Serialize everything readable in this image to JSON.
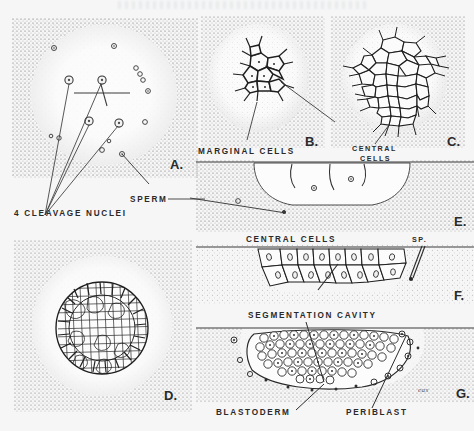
{
  "plate": {
    "title": "Cleavage and blastoderm formation plate",
    "background_color": "#f6f6f7",
    "ink_color": "#2a2a2a",
    "signature": "eas"
  },
  "panels": [
    {
      "id": "A",
      "marker": "A.",
      "view": "surface view of egg with cleavage nuclei and sperm",
      "labels": [
        {
          "name": "cleavage-nuclei",
          "text": "4 CLEAVAGE  NUCLEI"
        },
        {
          "name": "sperm",
          "text": "SPERM"
        }
      ],
      "nuclei_count": 4,
      "sperm_count": 12
    },
    {
      "id": "B",
      "marker": "B.",
      "view": "early blastodisc, marginal cells",
      "labels": [
        {
          "name": "marginal-cells",
          "text": "MARGINAL  CELLS"
        }
      ],
      "cell_count": 9
    },
    {
      "id": "C",
      "marker": "C.",
      "view": "later blastodisc, central cells",
      "labels": [
        {
          "name": "central-cells",
          "text": "CENTRAL\nCELLS"
        },
        {
          "name": "central-cells-line1",
          "text": "CENTRAL"
        },
        {
          "name": "central-cells-line2",
          "text": "CELLS"
        }
      ],
      "cell_count": 34
    },
    {
      "id": "D",
      "marker": "D.",
      "view": "multicellular blastodisc surface view",
      "labels": [],
      "cell_count": 120
    },
    {
      "id": "E",
      "marker": "E.",
      "view": "sagittal section, central cells",
      "labels": [
        {
          "name": "central-cells",
          "text": "CENTRAL  CELLS"
        },
        {
          "name": "sperm-abbrev",
          "text": "SP."
        }
      ]
    },
    {
      "id": "F",
      "marker": "F.",
      "view": "sagittal section, cell layers with sperm",
      "labels": [
        {
          "name": "sperm-abbrev",
          "text": "SP."
        }
      ]
    },
    {
      "id": "G",
      "marker": "G.",
      "view": "sagittal section, segmentation cavity with blastoderm and periblast",
      "labels": [
        {
          "name": "segmentation-cavity",
          "text": "SEGMENTATION  CAVITY"
        },
        {
          "name": "blastoderm",
          "text": "BLASTODERM"
        },
        {
          "name": "periblast",
          "text": "PERIBLAST"
        }
      ]
    }
  ]
}
